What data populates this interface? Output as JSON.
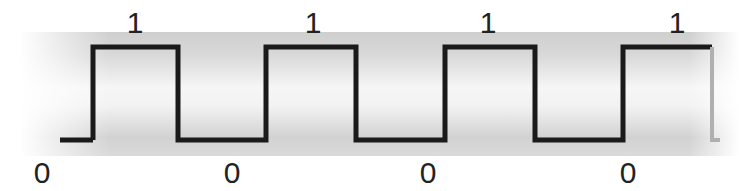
{
  "diagram": {
    "type": "digital-square-wave",
    "colors": {
      "background": "#ffffff",
      "band_dark": "#c8c8c8",
      "band_light": "#f4f4f4",
      "signal": "#1a1a1a",
      "signal_trailing": "#b0b0b0",
      "label": "#222222"
    },
    "band": {
      "x0": 20,
      "x1": 739,
      "y_top": 32,
      "y_bottom": 156
    },
    "levels": {
      "high_y": 47,
      "low_y": 140
    },
    "bits": [
      {
        "value": "0",
        "x_start": 20,
        "x_end": 93
      },
      {
        "value": "1",
        "x_start": 93,
        "x_end": 178
      },
      {
        "value": "0",
        "x_start": 178,
        "x_end": 266
      },
      {
        "value": "1",
        "x_start": 266,
        "x_end": 356
      },
      {
        "value": "0",
        "x_start": 356,
        "x_end": 445
      },
      {
        "value": "1",
        "x_start": 445,
        "x_end": 535
      },
      {
        "value": "0",
        "x_start": 535,
        "x_end": 623
      },
      {
        "value": "1",
        "x_start": 623,
        "x_end": 712
      }
    ],
    "high_labels": [
      {
        "text": "1",
        "x": 135,
        "y": 8
      },
      {
        "text": "1",
        "x": 313,
        "y": 8
      },
      {
        "text": "1",
        "x": 488,
        "y": 8
      },
      {
        "text": "1",
        "x": 677,
        "y": 8
      }
    ],
    "low_labels": [
      {
        "text": "0",
        "x": 42,
        "y": 158
      },
      {
        "text": "0",
        "x": 232,
        "y": 158
      },
      {
        "text": "0",
        "x": 428,
        "y": 158
      },
      {
        "text": "0",
        "x": 628,
        "y": 158
      }
    ]
  }
}
